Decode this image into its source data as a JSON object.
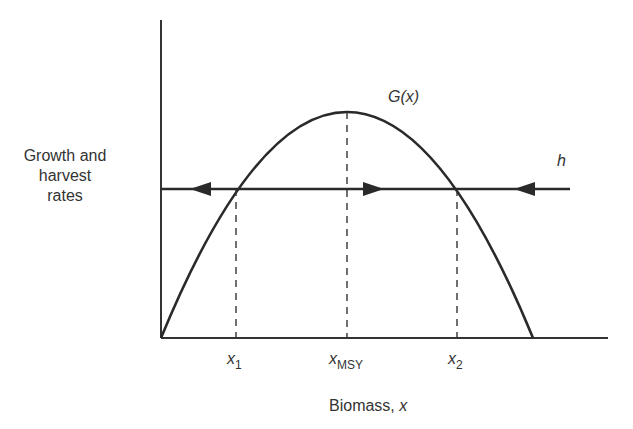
{
  "diagram": {
    "ylabel_lines": [
      "Growth and",
      "harvest",
      "rates"
    ],
    "xlabel": "Biomass, ",
    "xlabel_var": "x",
    "curve_label": "G(x)",
    "harvest_label": "h",
    "ticks": [
      {
        "var": "x",
        "sub": "1"
      },
      {
        "var": "x",
        "sub": "MSY"
      },
      {
        "var": "x",
        "sub": "2"
      }
    ],
    "colors": {
      "line": "#2a2a2a",
      "background": "#ffffff"
    }
  }
}
